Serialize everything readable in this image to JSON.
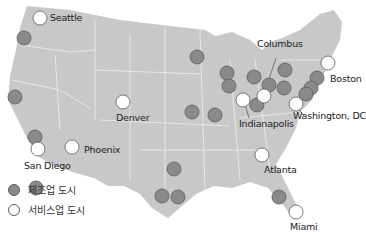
{
  "colors": {
    "land": "#c8c8c8",
    "border": "#eeeeee",
    "manufacturing": "#8a8a8a",
    "service": "#ffffff",
    "dot_stroke": "#5a5a5a"
  },
  "manufacturing_dots": [
    [
      24,
      38
    ],
    [
      15,
      97
    ],
    [
      35,
      137
    ],
    [
      36,
      188
    ],
    [
      197,
      57
    ],
    [
      227,
      73
    ],
    [
      229,
      86
    ],
    [
      254,
      77
    ],
    [
      285,
      70
    ],
    [
      269,
      85
    ],
    [
      284,
      88
    ],
    [
      257,
      105
    ],
    [
      192,
      112
    ],
    [
      215,
      115
    ],
    [
      317,
      78
    ],
    [
      311,
      88
    ],
    [
      306,
      94
    ],
    [
      174,
      169
    ],
    [
      162,
      196
    ],
    [
      178,
      197
    ],
    [
      279,
      197
    ]
  ],
  "service_dots": [
    [
      40,
      18
    ],
    [
      123,
      102
    ],
    [
      243,
      100
    ],
    [
      264,
      96
    ],
    [
      328,
      63
    ],
    [
      296,
      104
    ],
    [
      38,
      149
    ],
    [
      72,
      147
    ],
    [
      262,
      155
    ],
    [
      296,
      212
    ]
  ],
  "labels": {
    "seattle": "Seattle",
    "columbus": "Columbus",
    "boston": "Boston",
    "denver": "Denver",
    "indianapolis": "Indianapolis",
    "washington": "Washington, DC",
    "san_diego": "San Diego",
    "phoenix": "Phoenix",
    "atlanta": "Atlanta",
    "miami": "Miami"
  },
  "legend": {
    "manufacturing": "제조업 도시",
    "service": "서비스업 도시"
  }
}
